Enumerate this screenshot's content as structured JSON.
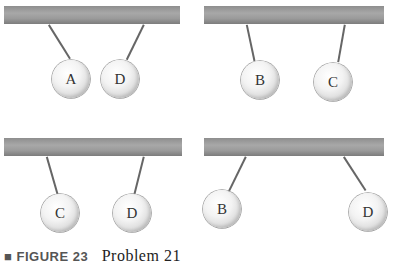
{
  "figure": {
    "panels": [
      {
        "balls": [
          {
            "label": "A"
          },
          {
            "label": "D"
          }
        ]
      },
      {
        "balls": [
          {
            "label": "B"
          },
          {
            "label": "C"
          }
        ]
      },
      {
        "balls": [
          {
            "label": "C"
          },
          {
            "label": "D"
          }
        ]
      },
      {
        "balls": [
          {
            "label": "B"
          },
          {
            "label": "D"
          }
        ]
      }
    ],
    "caption": {
      "figure_label": "■ FIGURE 23",
      "text": "Problem 21"
    },
    "colors": {
      "bar": "#9a9a9a",
      "string": "#666666",
      "ball": "#e8e8e8"
    }
  }
}
